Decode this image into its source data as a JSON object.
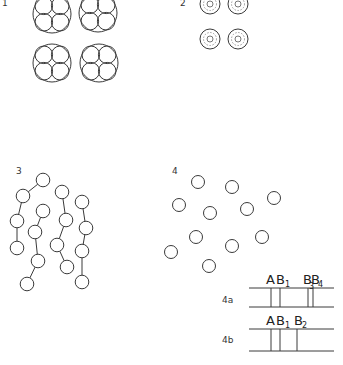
{
  "figure": {
    "panels": [
      {
        "id": "1",
        "label": "1",
        "description": "four large circles each containing four packed inner circles"
      },
      {
        "id": "2",
        "label": "2",
        "description": "four concentric ring particles"
      },
      {
        "id": "3",
        "label": "3",
        "description": "four chains of linked circles"
      },
      {
        "id": "4",
        "label": "4",
        "description": "scattered separate circles"
      }
    ],
    "bands": {
      "rows": [
        {
          "label": "4a",
          "markers": [
            "A",
            "B",
            "1",
            "B",
            "3",
            "B",
            "4"
          ],
          "marker_text": [
            {
              "main": "A",
              "sub": ""
            },
            {
              "main": "B",
              "sub": "1"
            },
            {
              "main": "B",
              "sub": "3"
            },
            {
              "main": "B",
              "sub": "4"
            }
          ]
        },
        {
          "label": "4b",
          "marker_text": [
            {
              "main": "A",
              "sub": ""
            },
            {
              "main": "B",
              "sub": "1"
            },
            {
              "main": "B",
              "sub": "2"
            }
          ]
        }
      ]
    }
  }
}
